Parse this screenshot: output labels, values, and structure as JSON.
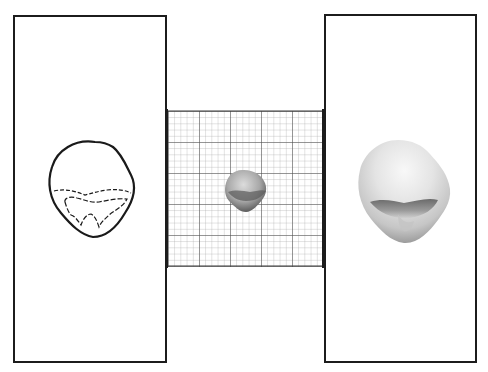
{
  "figure": {
    "panels": [
      {
        "id": "left",
        "content": "outline drawing of tooth crown with dashed inner contours"
      },
      {
        "id": "center",
        "content": "photograph of small tooth on millimeter grid paper"
      },
      {
        "id": "right",
        "content": "enlarged photograph of tooth crown"
      }
    ],
    "grid": {
      "minor_cells_per_major": 5,
      "major_divisions_x": 5,
      "major_divisions_y": 5,
      "line_color": "#555555",
      "minor_line_color": "#9a9a9a"
    },
    "colors": {
      "border": "#1c1c1c",
      "background": "#ffffff",
      "tooth_light": "#e6e6e6",
      "tooth_shadow": "#6e6e6e"
    }
  }
}
